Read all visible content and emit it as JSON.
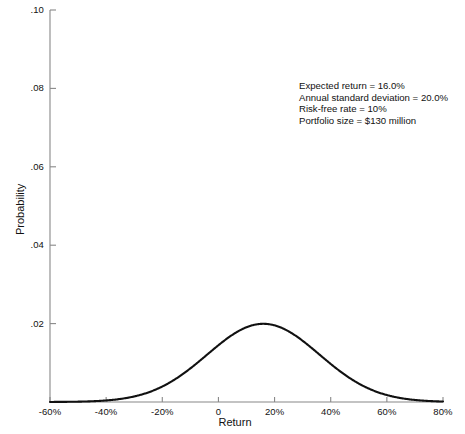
{
  "chart_data": {
    "type": "line",
    "title": "",
    "xlabel": "Return",
    "ylabel": "Probability",
    "xlim": [
      -60,
      80
    ],
    "ylim": [
      0,
      0.1
    ],
    "grid": false,
    "legend": "none",
    "x_ticks": [
      {
        "value": -60,
        "label": "-60%"
      },
      {
        "value": -40,
        "label": "-40%"
      },
      {
        "value": -20,
        "label": "-20%"
      },
      {
        "value": 0,
        "label": "0"
      },
      {
        "value": 20,
        "label": "20%"
      },
      {
        "value": 40,
        "label": "40%"
      },
      {
        "value": 60,
        "label": "60%"
      },
      {
        "value": 80,
        "label": "80%"
      }
    ],
    "y_ticks": [
      {
        "value": 0.02,
        "label": ".02"
      },
      {
        "value": 0.04,
        "label": ".04"
      },
      {
        "value": 0.06,
        "label": ".06"
      },
      {
        "value": 0.08,
        "label": ".08"
      },
      {
        "value": 0.1,
        "label": ".10"
      }
    ],
    "series": [
      {
        "name": "Return distribution",
        "distribution": "normal",
        "mean": 16.0,
        "std_dev": 20.0,
        "peak_value": 0.0399,
        "color": "#111111",
        "x": [
          -60,
          -55,
          -50,
          -45,
          -40,
          -35,
          -30,
          -25,
          -20,
          -15,
          -10,
          -5,
          0,
          5,
          10,
          15,
          16,
          20,
          25,
          30,
          35,
          40,
          45,
          50,
          55,
          60,
          65,
          70,
          75,
          80
        ],
        "values": [
          0.00015,
          0.00035,
          0.00076,
          0.00154,
          0.00292,
          0.00517,
          0.00857,
          0.0133,
          0.01933,
          0.02637,
          0.03371,
          0.04033,
          0.0452,
          0.0476,
          0.04721,
          0.04394,
          0.043,
          0.03822,
          0.03123,
          0.02395,
          0.01723,
          0.01161,
          0.00733,
          0.00434,
          0.00241,
          0.00125,
          0.00061,
          0.00028,
          0.00012,
          5e-05
        ]
      }
    ],
    "annotations": [
      "Expected return = 16.0%",
      "Annual standard deviation = 20.0%",
      "Risk-free rate = 10%",
      "Portfolio size = $130 million"
    ]
  },
  "axis": {
    "x_title": "Return",
    "y_title": "Probability"
  }
}
